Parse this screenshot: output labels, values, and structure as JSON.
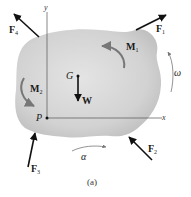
{
  "figure": {
    "caption": "(a)",
    "body": {
      "fill": "#c9c9c9",
      "fill_highlight": "#e2e2e2"
    },
    "axes": {
      "x_label": "x",
      "y_label": "y",
      "origin_label": "P"
    },
    "center_of_gravity": {
      "label": "G",
      "weight_label": "W"
    },
    "forces": [
      {
        "name": "F",
        "sub": "1"
      },
      {
        "name": "F",
        "sub": "2"
      },
      {
        "name": "F",
        "sub": "3"
      },
      {
        "name": "F",
        "sub": "4"
      }
    ],
    "moments": [
      {
        "name": "M",
        "sub": "1"
      },
      {
        "name": "M",
        "sub": "2"
      }
    ],
    "angular_velocity": "ω",
    "angular_acceleration": "α"
  }
}
